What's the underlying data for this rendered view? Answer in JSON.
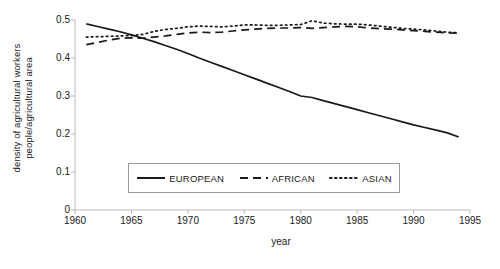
{
  "chart_data": {
    "type": "line",
    "title": "",
    "xlabel": "year",
    "ylabel_line1": "density of agricultural workers",
    "ylabel_line2": "people/agricultural area",
    "xlim": [
      1960,
      1995
    ],
    "ylim": [
      0,
      0.5
    ],
    "xticks": [
      1960,
      1965,
      1970,
      1975,
      1980,
      1985,
      1990,
      1995
    ],
    "xtick_labels": [
      "1960",
      "1965",
      "1970",
      "1975",
      "1980",
      "1985",
      "1990",
      "1995"
    ],
    "yticks": [
      0,
      0.1,
      0.2,
      0.3,
      0.4,
      0.5
    ],
    "ytick_labels": [
      "0",
      "0.1",
      "0.2",
      "0.3",
      "0.4",
      "0.5"
    ],
    "grid": false,
    "legend_position": "lower-center",
    "series": [
      {
        "name": "EUROPEAN",
        "style": "solid",
        "color": "#1a1a1a",
        "x": [
          1961,
          1962,
          1963,
          1964,
          1965,
          1966,
          1967,
          1968,
          1969,
          1970,
          1971,
          1972,
          1973,
          1974,
          1975,
          1976,
          1977,
          1978,
          1979,
          1980,
          1981,
          1982,
          1983,
          1984,
          1985,
          1986,
          1987,
          1988,
          1989,
          1990,
          1991,
          1992,
          1993,
          1994
        ],
        "values": [
          0.49,
          0.483,
          0.476,
          0.469,
          0.461,
          0.452,
          0.443,
          0.433,
          0.423,
          0.412,
          0.4,
          0.389,
          0.378,
          0.367,
          0.356,
          0.345,
          0.334,
          0.323,
          0.312,
          0.3,
          0.296,
          0.288,
          0.28,
          0.272,
          0.264,
          0.256,
          0.248,
          0.24,
          0.232,
          0.224,
          0.217,
          0.21,
          0.203,
          0.192
        ]
      },
      {
        "name": "AFRICAN",
        "style": "dashed",
        "color": "#1a1a1a",
        "x": [
          1961,
          1962,
          1963,
          1964,
          1965,
          1966,
          1967,
          1968,
          1969,
          1970,
          1971,
          1972,
          1973,
          1974,
          1975,
          1976,
          1977,
          1978,
          1979,
          1980,
          1981,
          1982,
          1983,
          1984,
          1985,
          1986,
          1987,
          1988,
          1989,
          1990,
          1991,
          1992,
          1993,
          1994
        ],
        "values": [
          0.435,
          0.441,
          0.447,
          0.452,
          0.453,
          0.452,
          0.455,
          0.458,
          0.462,
          0.466,
          0.468,
          0.467,
          0.468,
          0.471,
          0.474,
          0.476,
          0.478,
          0.479,
          0.479,
          0.48,
          0.478,
          0.48,
          0.482,
          0.483,
          0.482,
          0.479,
          0.477,
          0.476,
          0.474,
          0.472,
          0.47,
          0.468,
          0.466,
          0.465
        ]
      },
      {
        "name": "ASIAN",
        "style": "dotted",
        "color": "#1a1a1a",
        "x": [
          1961,
          1962,
          1963,
          1964,
          1965,
          1966,
          1967,
          1968,
          1969,
          1970,
          1971,
          1972,
          1973,
          1974,
          1975,
          1976,
          1977,
          1978,
          1979,
          1980,
          1981,
          1982,
          1983,
          1984,
          1985,
          1986,
          1987,
          1988,
          1989,
          1990,
          1991,
          1992,
          1993,
          1994
        ],
        "values": [
          0.455,
          0.456,
          0.457,
          0.458,
          0.459,
          0.462,
          0.47,
          0.475,
          0.478,
          0.482,
          0.484,
          0.483,
          0.482,
          0.484,
          0.487,
          0.487,
          0.486,
          0.486,
          0.487,
          0.488,
          0.498,
          0.492,
          0.49,
          0.489,
          0.489,
          0.487,
          0.484,
          0.481,
          0.478,
          0.476,
          0.474,
          0.471,
          0.468,
          0.466
        ]
      }
    ]
  },
  "legend": {
    "items": [
      {
        "label": "EUROPEAN",
        "style": "solid"
      },
      {
        "label": "AFRICAN",
        "style": "dashed"
      },
      {
        "label": "ASIAN",
        "style": "dotted"
      }
    ]
  },
  "axis": {
    "line_color": "#b9b9b9",
    "tick_color": "#b9b9b9"
  }
}
